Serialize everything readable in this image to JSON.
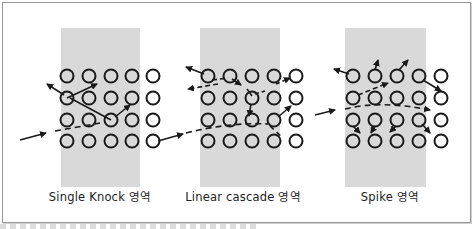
{
  "figure": {
    "panels": [
      {
        "id": "single-knock",
        "label": "Single Knock 영역",
        "label_x": 100,
        "shade": {
          "x": 61,
          "y": 28,
          "w": 79,
          "h": 159
        },
        "cols": [
          67,
          89,
          111,
          132,
          153
        ],
        "rows": [
          76,
          98,
          120,
          141
        ]
      },
      {
        "id": "linear-cascade",
        "label": "Linear cascade 영역",
        "label_x": 243,
        "shade": {
          "x": 200,
          "y": 28,
          "w": 80,
          "h": 159
        },
        "cols": [
          208,
          230,
          252,
          274,
          296
        ],
        "rows": [
          76,
          98,
          120,
          141
        ]
      },
      {
        "id": "spike",
        "label": "Spike 영역",
        "label_x": 390,
        "shade": {
          "x": 345,
          "y": 28,
          "w": 81,
          "h": 159
        },
        "cols": [
          353,
          375,
          397,
          419,
          441
        ],
        "rows": [
          76,
          98,
          120,
          141
        ]
      }
    ],
    "colors": {
      "shade": "#d9d9d9",
      "stroke": "#1a1a1a",
      "frame": "#9a9a9a"
    },
    "footer_text": ""
  }
}
